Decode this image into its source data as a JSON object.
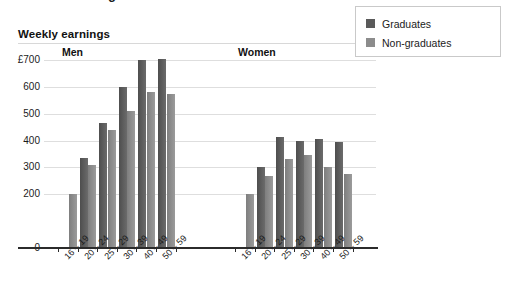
{
  "top_partial": {
    "glyph": "g",
    "note": "cut-off text from element above"
  },
  "title": "Weekly earnings",
  "legend": {
    "position": "top-right",
    "items": [
      {
        "label": "Graduates",
        "color": "#5a5a5a",
        "key": "graduates"
      },
      {
        "label": "Non-graduates",
        "color": "#8c8c8c",
        "key": "non_graduates"
      }
    ]
  },
  "y_axis": {
    "currency_prefix": "£",
    "ticks": [
      "£700",
      "600",
      "500",
      "400",
      "300",
      "200",
      "0"
    ],
    "tick_values": [
      700,
      600,
      500,
      400,
      300,
      200,
      0
    ],
    "min": 0,
    "max": 700
  },
  "groups": [
    {
      "key": "men",
      "heading": "Men"
    },
    {
      "key": "women",
      "heading": "Women"
    }
  ],
  "x_axis": {
    "categories": [
      "16 – 19",
      "20 – 24",
      "25 – 29",
      "30 – 39",
      "40 – 49",
      "50 – 59"
    ]
  },
  "chart_data": {
    "type": "bar",
    "title": "Weekly earnings",
    "xlabel": "",
    "ylabel": "£",
    "ylim": [
      0,
      700
    ],
    "grid": true,
    "legend_position": "top-right",
    "panels": [
      {
        "name": "Men",
        "categories": [
          "16 – 19",
          "20 – 24",
          "25 – 29",
          "30 – 39",
          "40 – 49",
          "50 – 59"
        ],
        "series": [
          {
            "name": "Graduates",
            "values": [
              null,
              335,
              465,
              600,
              700,
              705
            ]
          },
          {
            "name": "Non-graduates",
            "values": [
              200,
              310,
              440,
              510,
              580,
              575
            ]
          }
        ]
      },
      {
        "name": "Women",
        "categories": [
          "16 – 19",
          "20 – 24",
          "25 – 29",
          "30 – 39",
          "40 – 49",
          "50 – 59"
        ],
        "series": [
          {
            "name": "Graduates",
            "values": [
              null,
              300,
              415,
              400,
              405,
              395
            ]
          },
          {
            "name": "Non-graduates",
            "values": [
              200,
              270,
              330,
              345,
              300,
              275
            ]
          }
        ]
      }
    ]
  }
}
